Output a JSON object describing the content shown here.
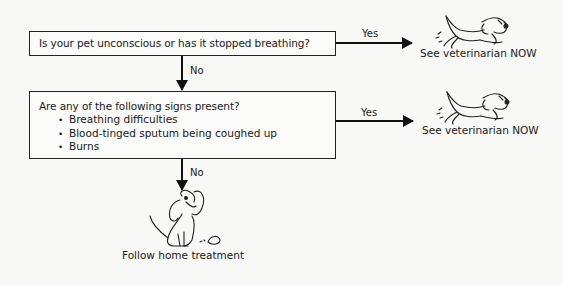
{
  "flowchart": {
    "question1": {
      "text": "Is your pet unconscious or has it stopped breathing?",
      "yes_label": "Yes",
      "no_label": "No",
      "yes_result": "See veterinarian NOW"
    },
    "question2": {
      "text": "Are any of the following signs present?",
      "signs": [
        "Breathing difficulties",
        "Blood-tinged sputum being coughed up",
        "Burns"
      ],
      "yes_label": "Yes",
      "no_label": "No",
      "yes_result": "See veterinarian NOW",
      "no_result": "Follow home treatment"
    }
  }
}
